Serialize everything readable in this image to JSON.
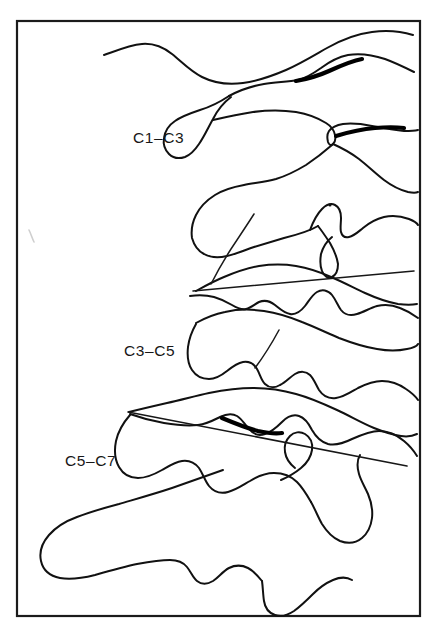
{
  "figure": {
    "kind": "line-drawing",
    "background_color": "#ffffff",
    "ink_color": "#111111",
    "frame": {
      "present": true,
      "color": "#1b1b1b",
      "x": 17,
      "y": 21,
      "width": 403,
      "height": 595
    },
    "labels": [
      {
        "id": "c1c3",
        "text": "C1–C3",
        "x": 133,
        "y": 129
      },
      {
        "id": "c3c5",
        "text": "C3–C5",
        "x": 124,
        "y": 342
      },
      {
        "id": "c5c7",
        "text": "C5–C7",
        "x": 65,
        "y": 452
      }
    ],
    "marks": {
      "speck": {
        "x": 330,
        "y": 205,
        "r": 1.6
      },
      "artifact_smudge": {
        "x1": 29,
        "y1": 231,
        "x2": 34,
        "y2": 241
      }
    },
    "guide_lines": [
      {
        "id": "upper-guide",
        "x1": 193,
        "y1": 291,
        "x2": 414,
        "y2": 271
      },
      {
        "id": "lower-guide",
        "x1": 128,
        "y1": 412,
        "x2": 407,
        "y2": 466
      }
    ]
  },
  "chart_data": {
    "type": "line",
    "xlabel": "",
    "ylabel": "",
    "series": [
      {
        "name": "C1–C3",
        "values": []
      },
      {
        "name": "C3–C5",
        "values": []
      },
      {
        "name": "C5–C7",
        "values": []
      }
    ]
  }
}
